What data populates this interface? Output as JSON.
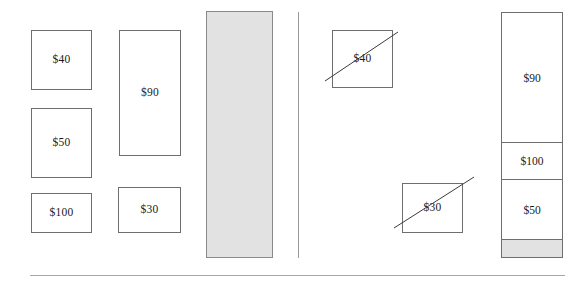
{
  "diagram": {
    "title": "",
    "colors": {
      "box_border": "#6e6e6e",
      "box_fill": "#ffffff",
      "shaded_fill": "#e2e2e2",
      "shaded_border": "#8a8a8a",
      "text": "#1a1a1a",
      "divider": "#9a9a9a",
      "rule": "#a8a8a8",
      "strike": "#3a3a3a"
    },
    "left_panel": {
      "name": "unpacked-items-panel",
      "boxes": [
        {
          "label": "$40",
          "x": 31,
          "y": 30,
          "w": 61,
          "h": 60
        },
        {
          "label": "$50",
          "x": 31,
          "y": 108,
          "w": 61,
          "h": 70
        },
        {
          "label": "$100",
          "x": 31,
          "y": 193,
          "w": 61,
          "h": 40
        },
        {
          "label": "$90",
          "x": 119,
          "y": 30,
          "w": 62,
          "h": 126
        },
        {
          "label": "$30",
          "x": 118,
          "y": 187,
          "w": 63,
          "h": 46
        }
      ],
      "container": {
        "name": "empty-knapsack",
        "label": "",
        "x": 206,
        "y": 11,
        "w": 67,
        "h": 247,
        "fill": "#e2e2e2"
      }
    },
    "divider": {
      "x": 298,
      "y": 12,
      "height": 246
    },
    "right_panel": {
      "name": "selected-items-panel",
      "boxes": [
        {
          "label": "$40",
          "x": 332,
          "y": 30,
          "w": 61,
          "h": 58,
          "struck": true,
          "strike": {
            "x1": -8,
            "y1": 50,
            "x2": 65,
            "y2": 1
          }
        },
        {
          "label": "$30",
          "x": 402,
          "y": 183,
          "w": 61,
          "h": 50,
          "struck": true,
          "strike": {
            "x1": -9,
            "y1": 44,
            "x2": 71,
            "y2": -7
          }
        }
      ],
      "container": {
        "name": "packed-knapsack",
        "x": 501,
        "y": 12,
        "w": 62,
        "h": 246,
        "segments": [
          {
            "label": "$90",
            "top": 0,
            "height": 129,
            "fill": "#ffffff",
            "divider_top": false
          },
          {
            "label": "$100",
            "top": 129,
            "height": 37,
            "fill": "#ffffff",
            "divider_top": true
          },
          {
            "label": "$50",
            "top": 166,
            "height": 60,
            "fill": "#ffffff",
            "divider_top": true
          },
          {
            "label": "",
            "top": 226,
            "height": 18,
            "fill": "#e2e2e2",
            "divider_top": true
          }
        ]
      }
    },
    "bottom_rule": {
      "x": 30,
      "y": 275,
      "width": 535
    }
  }
}
